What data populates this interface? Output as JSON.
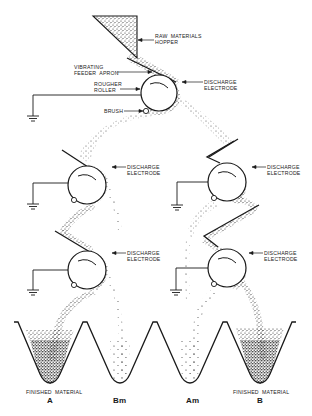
{
  "diagram": {
    "labels": {
      "hopper": [
        "RAW  MATERIALS",
        "HOPPER"
      ],
      "feeder": [
        "VIBRATING",
        "FEEDER  APRON"
      ],
      "roller": [
        "ROUGHER",
        "ROLLER"
      ],
      "brush": "BRUSH",
      "electrode_top": [
        "DISCHARGE",
        "ELECTRODE"
      ],
      "electrode_mid_left": [
        "DISCHARGE",
        "ELECTRODE"
      ],
      "electrode_mid_right": [
        "DISCHARGE",
        "ELECTRODE"
      ],
      "electrode_low_left": [
        "DISCHARGE",
        "ELECTRODE"
      ],
      "electrode_low_right": [
        "DISCHARGE",
        "ELECTRODE"
      ]
    },
    "bins": [
      {
        "caption": "FINISHED  MATERIAL",
        "name": "A",
        "fill": "heavy"
      },
      {
        "caption": "",
        "name": "Bm",
        "fill": "light"
      },
      {
        "caption": "",
        "name": "Am",
        "fill": "light"
      },
      {
        "caption": "FINISHED  MATERIAL",
        "name": "B",
        "fill": "heavy"
      }
    ],
    "colors": {
      "ink": "#1a1a1a",
      "background": "#ffffff"
    }
  }
}
